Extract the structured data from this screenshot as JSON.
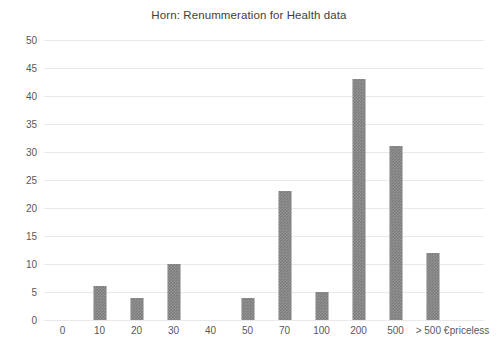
{
  "chart_data": {
    "type": "bar",
    "title": "Horn: Renummeration for Health data",
    "xlabel": "",
    "ylabel": "",
    "categories": [
      "0",
      "10",
      "20",
      "30",
      "40",
      "50",
      "70",
      "100",
      "200",
      "500",
      "> 500 €",
      "priceless"
    ],
    "values": [
      0,
      6,
      4,
      10,
      0,
      4,
      23,
      5,
      43,
      31,
      12,
      0
    ],
    "ylim": [
      0,
      50
    ],
    "y_ticks": [
      50,
      45,
      40,
      35,
      30,
      25,
      20,
      15,
      10,
      5,
      0
    ],
    "grid": true,
    "legend": "none",
    "series": [
      {
        "name": "Renummeration for Health data",
        "values": [
          0,
          6,
          4,
          10,
          0,
          4,
          23,
          5,
          43,
          31,
          12,
          0
        ]
      }
    ],
    "colors": {
      "bar": "#7b7b7b",
      "gridline": "#e9e9e9",
      "text": "#585858",
      "title": "#404040",
      "background": "#ffffff"
    }
  }
}
